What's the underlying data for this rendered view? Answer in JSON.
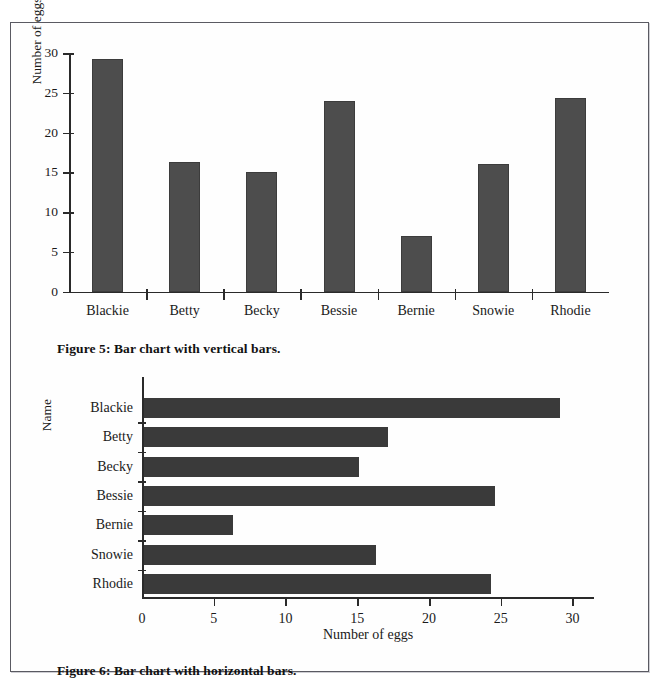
{
  "page": {
    "background": "#ffffff",
    "border_color": "#5a5a62"
  },
  "figures": [
    {
      "caption": "Figure  5: Bar chart with vertical bars.",
      "bar_color": "#4d4d4d"
    },
    {
      "caption": "Figure 6: Bar chart with horizontal bars.",
      "bar_color": "#3a3a3a"
    }
  ],
  "chart_data": [
    {
      "type": "bar",
      "orientation": "vertical",
      "title": "",
      "xlabel": "",
      "ylabel": "Number of eggs",
      "categories": [
        "Blackie",
        "Betty",
        "Becky",
        "Bessie",
        "Bernie",
        "Snowie",
        "Rhodie"
      ],
      "values": [
        29.3,
        16.3,
        15.0,
        24.0,
        7.0,
        16.0,
        24.3
      ],
      "ylim": [
        0,
        30
      ],
      "yticks": [
        0,
        5,
        10,
        15,
        20,
        25,
        30
      ],
      "yticklabels": [
        "0",
        "5",
        "10",
        "15",
        "20",
        "25",
        "30"
      ],
      "grid": false,
      "legend": false,
      "bar_color": "#4d4d4d"
    },
    {
      "type": "bar",
      "orientation": "horizontal",
      "title": "",
      "xlabel": "Number of eggs",
      "ylabel": "Name",
      "categories": [
        "Blackie",
        "Betty",
        "Becky",
        "Bessie",
        "Bernie",
        "Snowie",
        "Rhodie"
      ],
      "values": [
        29.0,
        17.0,
        15.0,
        24.5,
        6.2,
        16.2,
        24.2
      ],
      "xlim": [
        0,
        31.5
      ],
      "xticks": [
        0,
        5,
        10,
        15,
        20,
        25,
        30
      ],
      "xticklabels": [
        "0",
        "5",
        "10",
        "15",
        "20",
        "25",
        "30"
      ],
      "grid": false,
      "legend": false,
      "bar_color": "#3a3a3a"
    }
  ]
}
